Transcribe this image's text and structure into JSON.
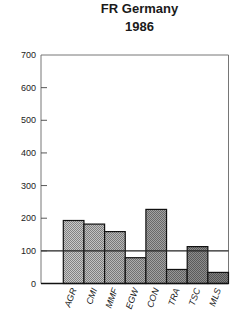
{
  "header": {
    "title_line1": "FR Germany",
    "title_line2": "1986"
  },
  "chart_data": {
    "type": "bar",
    "xlabel": "",
    "ylabel": "",
    "categories": [
      "AGR",
      "CMI",
      "MMF",
      "EGW",
      "CON",
      "TRA",
      "TSC",
      "MLS"
    ],
    "values": [
      193,
      182,
      159,
      79,
      227,
      43,
      113,
      34
    ],
    "ylim": [
      0,
      700
    ],
    "yticks": [
      0,
      100,
      200,
      300,
      400,
      500,
      600,
      700
    ],
    "reference_line": 100,
    "grid": false,
    "legend": null,
    "bar_shades": [
      "#c9c9c9",
      "#c2c2c2",
      "#b8b8b8",
      "#adadad",
      "#a2a2a2",
      "#979797",
      "#8c8c8c",
      "#808080"
    ]
  }
}
